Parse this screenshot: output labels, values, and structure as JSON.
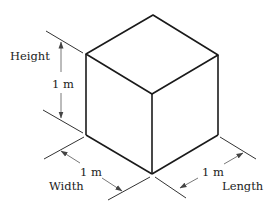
{
  "figure": {
    "labels": {
      "height": "Height",
      "width": "Width",
      "length": "Length"
    },
    "dimensions": {
      "height_value": "1 m",
      "width_value": "1 m",
      "length_value": "1 m"
    },
    "colors": {
      "line": "#1a1a1a",
      "background": "#ffffff"
    }
  }
}
